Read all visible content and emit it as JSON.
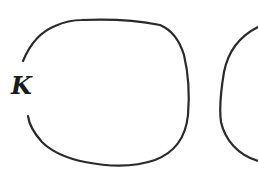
{
  "diagram": {
    "labels": {
      "k": "K"
    },
    "colors": {
      "stroke": "#2a2a2a",
      "background": "#ffffff",
      "label": "#1a1a1a"
    },
    "shapes": [
      {
        "name": "open-loop-curve",
        "description": "Closed-ish rounded curve with a gap on its left side where the label K sits"
      },
      {
        "name": "partial-right-curve",
        "description": "Partial rounded curve cut off at the right edge"
      }
    ]
  }
}
